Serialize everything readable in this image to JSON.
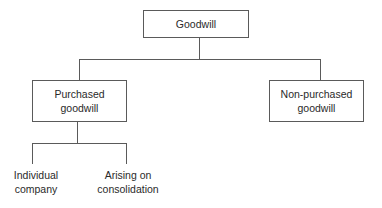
{
  "diagram": {
    "type": "tree",
    "root": {
      "label": "Goodwill",
      "children": [
        {
          "label_line1": "Purchased",
          "label_line2": "goodwill",
          "children": [
            {
              "label_line1": "Individual",
              "label_line2": "company"
            },
            {
              "label_line1": "Arising on",
              "label_line2": "consolidation"
            }
          ]
        },
        {
          "label_line1": "Non-purchased",
          "label_line2": "goodwill",
          "children": []
        }
      ]
    },
    "colors": {
      "line": "#5a5a5a",
      "text": "#2a2a2a",
      "background": "#ffffff"
    }
  }
}
